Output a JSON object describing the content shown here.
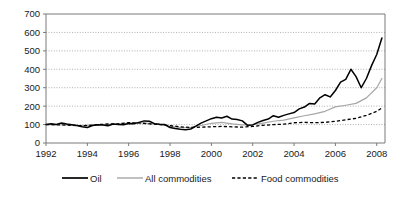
{
  "chart_data": {
    "type": "line",
    "title": "",
    "xlabel": "",
    "ylabel": "",
    "index_note": "Index, 1992 = 100",
    "xlim": [
      1992,
      2008.4
    ],
    "ylim": [
      0,
      700
    ],
    "ytick_step": 100,
    "grid": true,
    "legend_position": "bottom",
    "ytick_labels": [
      "0",
      "100",
      "200",
      "300",
      "400",
      "500",
      "600",
      "700"
    ],
    "ytick_values": [
      0,
      100,
      200,
      300,
      400,
      500,
      600,
      700
    ],
    "xtick_labels": [
      "1992",
      "1994",
      "1996",
      "1998",
      "2000",
      "2002",
      "2004",
      "2006",
      "2008"
    ],
    "xtick_values": [
      1992,
      1994,
      1996,
      1998,
      2000,
      2002,
      2004,
      2006,
      2008
    ],
    "colors": {
      "oil": "#000000",
      "all_commodities": "#a6a6a6",
      "food_commodities": "#000000",
      "grid": "#8c8c8c",
      "axis": "#7a7a7a"
    },
    "series": [
      {
        "name": "Oil",
        "style": "solid",
        "color": "#000000",
        "x": [
          1992.0,
          1992.25,
          1992.5,
          1992.75,
          1993.0,
          1993.25,
          1993.5,
          1993.75,
          1994.0,
          1994.25,
          1994.5,
          1994.75,
          1995.0,
          1995.25,
          1995.5,
          1995.75,
          1996.0,
          1996.25,
          1996.5,
          1996.75,
          1997.0,
          1997.25,
          1997.5,
          1997.75,
          1998.0,
          1998.25,
          1998.5,
          1998.75,
          1999.0,
          1999.25,
          1999.5,
          1999.75,
          2000.0,
          2000.25,
          2000.5,
          2000.75,
          2001.0,
          2001.25,
          2001.5,
          2001.75,
          2002.0,
          2002.25,
          2002.5,
          2002.75,
          2003.0,
          2003.25,
          2003.5,
          2003.75,
          2004.0,
          2004.25,
          2004.5,
          2004.75,
          2005.0,
          2005.25,
          2005.5,
          2005.75,
          2006.0,
          2006.25,
          2006.5,
          2006.75,
          2007.0,
          2007.25,
          2007.5,
          2007.75,
          2008.0,
          2008.25
        ],
        "values": [
          100,
          104,
          101,
          108,
          103,
          99,
          95,
          88,
          84,
          95,
          99,
          97,
          94,
          103,
          101,
          99,
          106,
          104,
          112,
          120,
          118,
          105,
          102,
          100,
          84,
          79,
          75,
          72,
          76,
          92,
          108,
          120,
          132,
          140,
          136,
          145,
          130,
          128,
          120,
          96,
          98,
          112,
          122,
          130,
          148,
          140,
          150,
          158,
          165,
          185,
          195,
          215,
          212,
          245,
          262,
          250,
          285,
          330,
          345,
          400,
          360,
          300,
          350,
          420,
          480,
          570
        ],
        "last_value": 570,
        "peak_value": 570,
        "peak_year": 2008.25,
        "trough_value": 72,
        "trough_year": 1998.75
      },
      {
        "name": "All commodities",
        "style": "solid",
        "color": "#a6a6a6",
        "x": [
          1992.0,
          1992.5,
          1993.0,
          1993.5,
          1994.0,
          1994.5,
          1995.0,
          1995.5,
          1996.0,
          1996.5,
          1997.0,
          1997.5,
          1998.0,
          1998.5,
          1999.0,
          1999.5,
          2000.0,
          2000.5,
          2001.0,
          2001.5,
          2002.0,
          2002.5,
          2003.0,
          2003.5,
          2004.0,
          2004.5,
          2005.0,
          2005.5,
          2006.0,
          2006.5,
          2007.0,
          2007.5,
          2008.0,
          2008.25
        ],
        "values": [
          100,
          100,
          98,
          95,
          96,
          100,
          101,
          103,
          108,
          110,
          106,
          101,
          90,
          84,
          84,
          95,
          107,
          112,
          104,
          98,
          100,
          108,
          118,
          124,
          136,
          148,
          158,
          172,
          196,
          205,
          215,
          245,
          300,
          350
        ],
        "last_value": 350
      },
      {
        "name": "Food commodities",
        "style": "dashed",
        "color": "#000000",
        "x": [
          1992.0,
          1992.5,
          1993.0,
          1993.5,
          1994.0,
          1994.5,
          1995.0,
          1995.5,
          1996.0,
          1996.5,
          1997.0,
          1997.5,
          1998.0,
          1998.5,
          1999.0,
          1999.5,
          2000.0,
          2000.5,
          2001.0,
          2001.5,
          2002.0,
          2002.5,
          2003.0,
          2003.5,
          2004.0,
          2004.5,
          2005.0,
          2005.5,
          2006.0,
          2006.5,
          2007.0,
          2007.5,
          2008.0,
          2008.25
        ],
        "values": [
          100,
          99,
          97,
          94,
          95,
          100,
          103,
          104,
          110,
          109,
          104,
          100,
          94,
          88,
          84,
          86,
          88,
          90,
          88,
          86,
          90,
          96,
          100,
          102,
          110,
          112,
          110,
          112,
          118,
          126,
          134,
          150,
          172,
          190
        ],
        "last_value": 190
      }
    ]
  },
  "legend": {
    "items": [
      {
        "label": "Oil",
        "style": "solid-black"
      },
      {
        "label": "All commodities",
        "style": "solid-gray"
      },
      {
        "label": "Food commodities",
        "style": "dashed-black"
      }
    ]
  }
}
